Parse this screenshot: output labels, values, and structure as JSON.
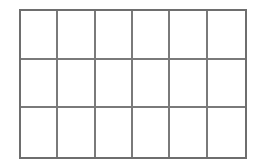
{
  "grid": {
    "rows": 3,
    "columns": 6,
    "line_color": "#6e6e6e",
    "background": "#ffffff",
    "cells": [
      [
        "",
        "",
        "",
        "",
        "",
        ""
      ],
      [
        "",
        "",
        "",
        "",
        "",
        ""
      ],
      [
        "",
        "",
        "",
        "",
        "",
        ""
      ]
    ]
  }
}
